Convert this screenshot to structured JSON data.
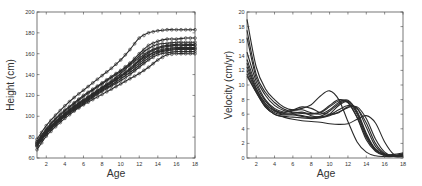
{
  "figure": {
    "background": "#ffffff",
    "line_color": "#2a2a2a",
    "axis_color": "#444444"
  },
  "chart_data": [
    {
      "id": "height",
      "type": "line",
      "title": "",
      "xlabel": "Age",
      "ylabel": "Height (cm)",
      "xlim": [
        1,
        18
      ],
      "ylim": [
        60,
        200
      ],
      "xticks": [
        2,
        4,
        6,
        8,
        10,
        12,
        14,
        16,
        18
      ],
      "yticks": [
        60,
        80,
        100,
        120,
        140,
        160,
        180,
        200
      ],
      "grid": false,
      "legend": null,
      "markers": "circle",
      "frame_px": {
        "left": 37,
        "top": 12,
        "right": 195,
        "bottom": 158
      },
      "x": [
        1,
        2,
        3,
        4,
        5,
        6,
        7,
        8,
        9,
        10,
        11,
        12,
        13,
        14,
        15,
        16,
        17,
        18
      ],
      "series": [
        {
          "name": "child 1",
          "values": [
            78,
            91,
            101,
            110,
            118,
            125,
            132,
            139,
            146,
            154,
            164,
            175,
            180,
            182,
            183,
            183,
            183,
            183
          ]
        },
        {
          "name": "child 2",
          "values": [
            76,
            88,
            98,
            106,
            113,
            120,
            126,
            132,
            138,
            144,
            151,
            160,
            168,
            172,
            174,
            174,
            175,
            175
          ]
        },
        {
          "name": "child 3",
          "values": [
            74,
            87,
            97,
            105,
            112,
            119,
            125,
            131,
            137,
            143,
            150,
            158,
            165,
            169,
            170,
            171,
            171,
            171
          ]
        },
        {
          "name": "child 4",
          "values": [
            75,
            86,
            95,
            103,
            110,
            116,
            122,
            128,
            134,
            141,
            149,
            156,
            162,
            166,
            168,
            169,
            169,
            169
          ]
        },
        {
          "name": "child 5",
          "values": [
            73,
            85,
            94,
            102,
            109,
            115,
            121,
            127,
            133,
            139,
            146,
            154,
            161,
            165,
            167,
            168,
            168,
            168
          ]
        },
        {
          "name": "child 6",
          "values": [
            72,
            84,
            93,
            101,
            108,
            114,
            120,
            126,
            132,
            138,
            144,
            151,
            158,
            163,
            165,
            166,
            166,
            166
          ]
        },
        {
          "name": "child 7",
          "values": [
            74,
            85,
            94,
            102,
            109,
            115,
            121,
            127,
            132,
            138,
            145,
            153,
            159,
            162,
            164,
            165,
            165,
            165
          ]
        },
        {
          "name": "child 8",
          "values": [
            71,
            83,
            92,
            100,
            107,
            113,
            119,
            125,
            130,
            136,
            142,
            149,
            156,
            161,
            163,
            164,
            164,
            164
          ]
        },
        {
          "name": "child 9",
          "values": [
            72,
            83,
            92,
            100,
            106,
            112,
            118,
            124,
            129,
            134,
            140,
            147,
            154,
            159,
            161,
            162,
            162,
            162
          ]
        },
        {
          "name": "child 10",
          "values": [
            68,
            81,
            90,
            98,
            105,
            111,
            116,
            121,
            126,
            131,
            136,
            141,
            147,
            154,
            159,
            160,
            160,
            160
          ]
        }
      ]
    },
    {
      "id": "velocity",
      "type": "line",
      "title": "",
      "xlabel": "Age",
      "ylabel": "Velocity (cm/yr)",
      "xlim": [
        1,
        18
      ],
      "ylim": [
        0,
        20
      ],
      "xticks": [
        2,
        4,
        6,
        8,
        10,
        12,
        14,
        16,
        18
      ],
      "yticks": [
        0,
        2,
        4,
        6,
        8,
        10,
        12,
        14,
        16,
        18,
        20
      ],
      "grid": false,
      "legend": null,
      "markers": "none",
      "frame_px": {
        "left": 247,
        "top": 12,
        "right": 403,
        "bottom": 158
      },
      "x": [
        1,
        2,
        3,
        4,
        5,
        6,
        7,
        8,
        9,
        10,
        11,
        12,
        13,
        14,
        15,
        16,
        17,
        18
      ],
      "series": [
        {
          "name": "child 1",
          "values": [
            19.0,
            12.5,
            9.5,
            8.0,
            7.0,
            6.6,
            6.8,
            7.3,
            8.5,
            9.2,
            8.0,
            5.0,
            2.2,
            0.8,
            0.3,
            0.2,
            0.2,
            0.3
          ]
        },
        {
          "name": "child 2",
          "values": [
            17.5,
            11.5,
            9.0,
            7.6,
            6.7,
            6.3,
            6.2,
            6.1,
            6.3,
            7.2,
            8.0,
            7.6,
            5.5,
            2.5,
            0.9,
            0.3,
            0.2,
            0.3
          ]
        },
        {
          "name": "child 3",
          "values": [
            16.5,
            11.0,
            8.6,
            7.2,
            6.5,
            6.2,
            6.1,
            6.0,
            6.2,
            7.0,
            7.8,
            7.6,
            5.6,
            2.8,
            1.0,
            0.4,
            0.3,
            0.4
          ]
        },
        {
          "name": "child 4",
          "values": [
            14.5,
            10.5,
            8.0,
            6.8,
            6.3,
            6.5,
            6.6,
            6.2,
            6.0,
            6.6,
            7.6,
            7.9,
            6.2,
            3.2,
            1.2,
            0.4,
            0.3,
            0.6
          ]
        },
        {
          "name": "child 5",
          "values": [
            13.5,
            10.0,
            7.8,
            6.6,
            6.1,
            6.0,
            5.8,
            5.6,
            5.7,
            6.4,
            7.4,
            7.8,
            6.4,
            3.4,
            1.2,
            0.5,
            0.4,
            0.5
          ]
        },
        {
          "name": "child 6",
          "values": [
            13.0,
            9.6,
            7.5,
            6.5,
            6.2,
            6.6,
            7.0,
            6.8,
            6.2,
            6.0,
            6.2,
            7.0,
            6.8,
            4.2,
            1.6,
            0.5,
            0.3,
            0.4
          ]
        },
        {
          "name": "child 7",
          "values": [
            12.5,
            9.4,
            7.4,
            6.4,
            6.0,
            6.1,
            6.3,
            5.8,
            5.6,
            6.0,
            7.2,
            7.7,
            6.0,
            3.0,
            1.1,
            0.5,
            0.5,
            0.7
          ]
        },
        {
          "name": "child 8",
          "values": [
            12.0,
            9.2,
            7.2,
            6.2,
            5.9,
            5.9,
            5.7,
            5.5,
            5.6,
            5.9,
            6.6,
            7.2,
            6.8,
            4.8,
            2.0,
            0.6,
            0.3,
            0.3
          ]
        },
        {
          "name": "child 9",
          "values": [
            11.5,
            9.0,
            7.0,
            6.0,
            5.7,
            5.6,
            5.5,
            5.4,
            5.5,
            5.8,
            6.3,
            6.9,
            7.0,
            5.4,
            2.6,
            0.8,
            0.2,
            0.2
          ]
        },
        {
          "name": "child 10",
          "values": [
            11.2,
            9.0,
            7.0,
            6.0,
            5.6,
            5.3,
            5.1,
            5.0,
            4.9,
            4.7,
            4.6,
            4.7,
            5.3,
            5.8,
            4.8,
            2.2,
            0.5,
            0.3
          ]
        }
      ]
    }
  ]
}
